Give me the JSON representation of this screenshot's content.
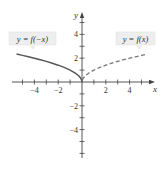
{
  "chart_data": {
    "type": "line",
    "title": "",
    "xlabel": "x",
    "ylabel": "y",
    "xlim": [
      -5.8,
      6.2
    ],
    "ylim": [
      -6.2,
      5.8
    ],
    "grid": false,
    "x_ticks": [
      -5,
      -4,
      -3,
      -2,
      -1,
      1,
      2,
      3,
      4,
      5
    ],
    "x_tick_labels": [
      {
        "value": -4,
        "text": "−4"
      },
      {
        "value": -2,
        "text": "−2"
      },
      {
        "value": 2,
        "text": "2"
      },
      {
        "value": 4,
        "text": "4"
      }
    ],
    "y_ticks": [
      -6,
      -5,
      -4,
      -3,
      -2,
      -1,
      1,
      2,
      3,
      4,
      5
    ],
    "y_tick_labels": [
      {
        "value": 4,
        "text": "4"
      },
      {
        "value": 2,
        "text": "2"
      },
      {
        "value": -2,
        "text": "−2"
      },
      {
        "value": -4,
        "text": "−4"
      }
    ],
    "series": [
      {
        "name": "y = f(−x)",
        "style": "solid",
        "color": "#555555",
        "function": "sqrt(-x)",
        "x": [
          -5.5,
          -5,
          -4.5,
          -4,
          -3.5,
          -3,
          -2.5,
          -2,
          -1.5,
          -1,
          -0.6,
          -0.3,
          -0.1,
          -0.02,
          0
        ],
        "y": [
          2.345,
          2.236,
          2.121,
          2.0,
          1.871,
          1.732,
          1.581,
          1.414,
          1.225,
          1.0,
          0.775,
          0.548,
          0.316,
          0.141,
          0
        ]
      },
      {
        "name": "y = f(x)",
        "style": "dashed",
        "color": "#777777",
        "function": "sqrt(x)",
        "x": [
          0,
          0.02,
          0.1,
          0.3,
          0.6,
          1,
          1.5,
          2,
          2.5,
          3,
          3.5,
          4,
          4.5,
          5,
          5.5
        ],
        "y": [
          0,
          0.141,
          0.316,
          0.548,
          0.775,
          1.0,
          1.225,
          1.414,
          1.581,
          1.732,
          1.871,
          2.0,
          2.121,
          2.236,
          2.345
        ]
      }
    ],
    "annotations": [
      {
        "text": "y = f(−x)",
        "points_to_series": 0,
        "placement": "top-left",
        "anchor_x": -3.0
      },
      {
        "text": "y = f(x)",
        "points_to_series": 1,
        "placement": "top-right",
        "anchor_x": 3.0
      }
    ]
  },
  "labels": {
    "x_axis": "x",
    "y_axis": "y",
    "left_curve": "y = f(−x)",
    "right_curve": "y = f(x)"
  },
  "colors": {
    "axis": "#444444",
    "solid_curve": "#555555",
    "dashed_curve": "#777777",
    "label_box": "#eeeeee",
    "label_box_border": "#dddddd"
  }
}
